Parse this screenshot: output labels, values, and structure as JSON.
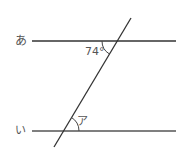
{
  "diagram": {
    "lines": {
      "top": {
        "name": "あ",
        "y": 41,
        "x1": 32,
        "x2": 176
      },
      "bottom": {
        "name": "い",
        "y": 131,
        "x1": 32,
        "x2": 176
      }
    },
    "transversal": {
      "x1": 131,
      "y1": 18,
      "x2": 54,
      "y2": 147
    },
    "angles": {
      "given": {
        "label": "74°",
        "value": 74
      },
      "unknown": {
        "label": "ア"
      }
    },
    "colors": {
      "line": "#333333",
      "label": "#555555"
    }
  }
}
